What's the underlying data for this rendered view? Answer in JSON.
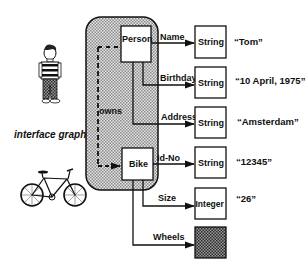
{
  "diagram": {
    "caption": "interface graph",
    "container": {
      "fill": "#d4d4d4",
      "pattern": "dotted-gray"
    },
    "nodes": {
      "person": {
        "label": "Person"
      },
      "bike": {
        "label": "Bike"
      }
    },
    "relation": {
      "label": "owns",
      "from": "Person",
      "to": "Bike",
      "style": "dashed"
    },
    "attributes": [
      {
        "edge": "Name",
        "from": "Person",
        "type": "String",
        "value": "“Tom”"
      },
      {
        "edge": "Birthday",
        "from": "Person",
        "type": "String",
        "value": "“10 April, 1975”"
      },
      {
        "edge": "Address",
        "from": "Person",
        "type": "String",
        "value": "“Amsterdam”"
      },
      {
        "edge": "Id-No",
        "from": "Bike",
        "type": "String",
        "value": "“12345”"
      },
      {
        "edge": "Size",
        "from": "Bike",
        "type": "Integer",
        "value": "“26”"
      },
      {
        "edge": "Wheels",
        "from": "Bike",
        "type": "",
        "value": ""
      }
    ],
    "icons": {
      "person_icon": "person-illustration",
      "bike_icon": "bicycle-illustration"
    }
  }
}
